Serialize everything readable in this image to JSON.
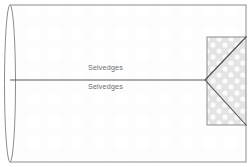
{
  "figure": {
    "width": 250,
    "height": 167,
    "background_color": "#ffffff"
  },
  "labels": {
    "selvedge_top": "Selvedges",
    "selvedge_bottom": "Selvedges"
  },
  "colors": {
    "outline": "#8c8c8c",
    "fold_line": "#5a5a5a",
    "diagonal_line": "#4a4a4a",
    "text": "#6e6e6e",
    "shaded_fill": "#e8e8e8",
    "dot_pattern": "#fafafa",
    "body_fill": "#fdfdfd",
    "faint_pattern": "#fbfbfb"
  },
  "geometry": {
    "body_rect": {
      "x": 10,
      "y": 5,
      "width": 236,
      "height": 157
    },
    "fold_ellipse": {
      "cx": 10,
      "cy": 83.5,
      "rx": 5.5,
      "ry": 78.5
    },
    "center_fold_line": {
      "x1": 10,
      "y1": 80,
      "x2": 205,
      "y2": 80
    },
    "shaded_rect": {
      "x": 207,
      "y": 37,
      "width": 39,
      "height": 88
    },
    "apex": {
      "x": 205,
      "y": 80
    },
    "diagonal_upper": {
      "x1": 205,
      "y1": 80,
      "x2": 246,
      "y2": 37
    },
    "diagonal_lower": {
      "x1": 205,
      "y1": 80,
      "x2": 246,
      "y2": 125
    }
  }
}
